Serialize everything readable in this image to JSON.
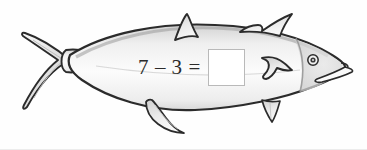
{
  "worksheet": {
    "title": "Fish subtraction worksheet",
    "background_color": "#fefefe",
    "ink_color": "#2b2b2b",
    "body_fill_color": "#fbfbfb",
    "shading_color": "#c9c9c9"
  },
  "equation": {
    "first_operand": "7",
    "operator": "–",
    "second_operand": "3",
    "equals": "=",
    "answer_value": "",
    "answer_placeholder": ""
  },
  "illustration": {
    "subject": "fish",
    "parts": [
      {
        "name": "body",
        "label": "fish body"
      },
      {
        "name": "tail-fin",
        "label": "forked caudal tail fin"
      },
      {
        "name": "caudal-peduncle",
        "label": "narrow tail base"
      },
      {
        "name": "first-dorsal-fin",
        "label": "small pointed dorsal fin"
      },
      {
        "name": "second-dorsal-fin",
        "label": "swept back dorsal fin"
      },
      {
        "name": "pelvic-fin",
        "label": "pelvic fin"
      },
      {
        "name": "anal-fin",
        "label": "anal fin"
      },
      {
        "name": "pectoral-fin",
        "label": "pectoral fin"
      },
      {
        "name": "gill-cover",
        "label": "gill cover line"
      },
      {
        "name": "eye",
        "label": "eye"
      },
      {
        "name": "mouth",
        "label": "mouth"
      }
    ]
  }
}
